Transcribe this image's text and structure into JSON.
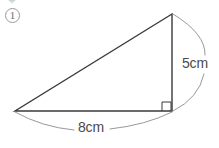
{
  "figure": {
    "item_number": "1",
    "background_color": "#ffffff",
    "stroke_color": "#3a3a3a",
    "arc_color": "#8c8c8c",
    "label_color": "#4a4a4a",
    "shape": "right-triangle",
    "right_angle_vertex": "bottom-right",
    "vertices": {
      "apex": [
        172,
        14
      ],
      "bottom_left": [
        15,
        111
      ],
      "bottom_right": [
        172,
        111
      ]
    },
    "right_angle_marker": {
      "x": 162,
      "y": 102,
      "size": 9
    },
    "dimensions": [
      {
        "name": "vertical-side",
        "label": "5cm",
        "value": 5,
        "unit": "cm",
        "side": "right",
        "from": [
          172,
          14
        ],
        "to": [
          172,
          111
        ]
      },
      {
        "name": "horizontal-side",
        "label": "8cm",
        "value": 8,
        "unit": "cm",
        "side": "bottom",
        "from": [
          15,
          111
        ],
        "to": [
          172,
          111
        ]
      }
    ]
  }
}
